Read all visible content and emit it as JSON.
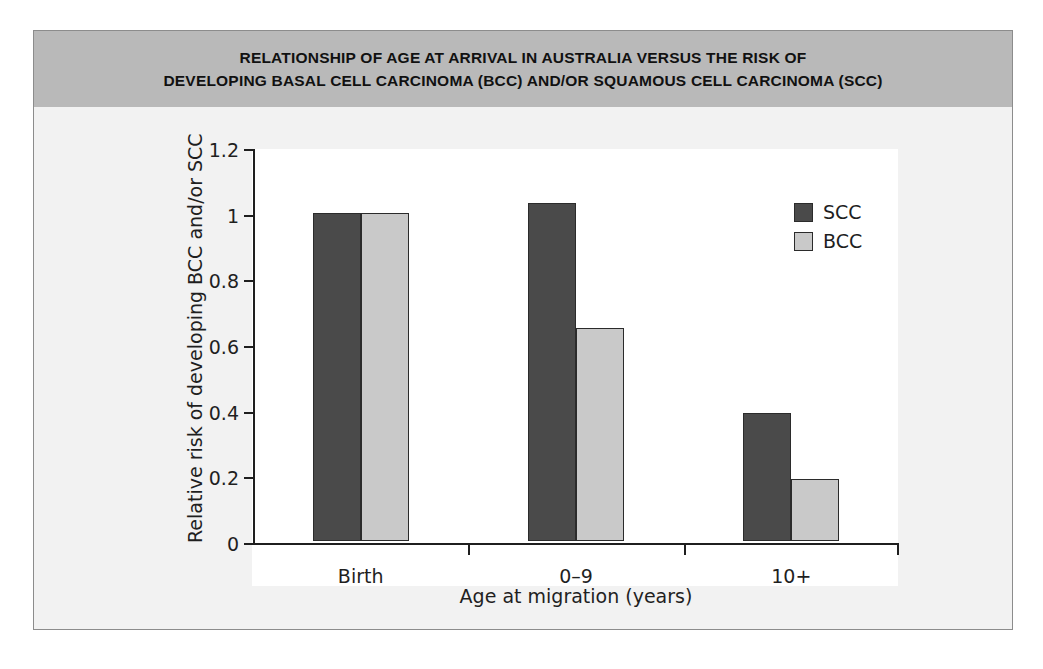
{
  "figure": {
    "title_lines": [
      "RELATIONSHIP OF AGE AT ARRIVAL IN AUSTRALIA VERSUS THE RISK OF",
      "DEVELOPING BASAL CELL CARCINOMA (BCC) AND/OR SQUAMOUS CELL CARCINOMA (SCC)"
    ],
    "title_band_color": "#b9b9b9",
    "page_background": "#f2f2f2",
    "plot_background": "#ffffff"
  },
  "chart_data": {
    "type": "bar",
    "title": "RELATIONSHIP OF AGE AT ARRIVAL IN AUSTRALIA VERSUS THE RISK OF DEVELOPING BASAL CELL CARCINOMA (BCC) AND/OR SQUAMOUS CELL CARCINOMA (SCC)",
    "xlabel": "Age at migration (years)",
    "ylabel": "Relative risk of developing BCC and/or SCC",
    "categories": [
      "Birth",
      "0–9",
      "10+"
    ],
    "series": [
      {
        "name": "SCC",
        "color": "#4a4a4a",
        "values": [
          1.0,
          1.03,
          0.39
        ]
      },
      {
        "name": "BCC",
        "color": "#c9c9c9",
        "values": [
          1.0,
          0.65,
          0.19
        ]
      }
    ],
    "ylim": [
      0,
      1.2
    ],
    "yticks": [
      0,
      0.2,
      0.4,
      0.6,
      0.8,
      1,
      1.2
    ],
    "ytick_labels": [
      "0",
      "0.2",
      "0.4",
      "0.6",
      "0.8",
      "1",
      "1.2"
    ],
    "grid": false,
    "legend_position": "top-right",
    "legend": [
      "SCC",
      "BCC"
    ]
  }
}
